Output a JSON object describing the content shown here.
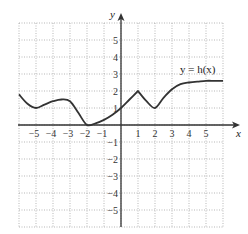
{
  "chart_data": {
    "type": "line",
    "title": "",
    "xlabel": "x",
    "ylabel": "y",
    "curve_label": "y = h(x)",
    "xlim": [
      -6,
      6
    ],
    "ylim": [
      -6,
      6
    ],
    "grid": true,
    "x_ticks": [
      "−5",
      "−4",
      "−3",
      "−2",
      "−1",
      "1",
      "2",
      "3",
      "4",
      "5"
    ],
    "y_ticks": [
      "5",
      "4",
      "3",
      "2",
      "1",
      "−1",
      "−2",
      "−3",
      "−4",
      "−5"
    ],
    "series": [
      {
        "name": "h(x)",
        "x": [
          -6,
          -5.5,
          -5,
          -4.5,
          -4,
          -3.5,
          -3,
          -2.5,
          -2,
          -1.5,
          -1,
          -0.5,
          0,
          0.5,
          1,
          1.5,
          2,
          2.5,
          3,
          3.5,
          4,
          4.5,
          5,
          5.5,
          6
        ],
        "y": [
          1.8,
          1.25,
          1.0,
          1.2,
          1.4,
          1.5,
          1.4,
          0.7,
          0.0,
          0.1,
          0.3,
          0.6,
          1.0,
          1.5,
          2.0,
          1.4,
          1.0,
          1.6,
          2.1,
          2.4,
          2.5,
          2.55,
          2.6,
          2.6,
          2.6
        ]
      }
    ],
    "features": {
      "cusp": [
        1,
        2
      ],
      "local_min": [
        [
          -5,
          1
        ],
        [
          -2,
          0
        ],
        [
          2,
          1
        ]
      ],
      "local_max": [
        [
          -3.5,
          1.5
        ]
      ],
      "horizontal_asymptote_approx": 2.6
    }
  }
}
